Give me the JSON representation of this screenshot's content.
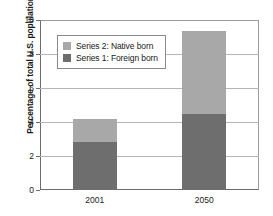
{
  "chart_data": {
    "type": "bar",
    "subtype": "stacked-vertical",
    "title": "",
    "xlabel": "",
    "ylabel": "Percentage of total U.S. population",
    "categories": [
      "2001",
      "2050"
    ],
    "series": [
      {
        "name": "Series 1: Foreign born",
        "values": [
          2.8,
          4.45
        ],
        "color": "#6e6e6e"
      },
      {
        "name": "Series 2: Native born",
        "values": [
          1.4,
          4.9
        ],
        "color": "#a8a8a8"
      }
    ],
    "stack_order": [
      "Series 1: Foreign born",
      "Series 2: Native born"
    ],
    "totals": [
      4.2,
      9.35
    ],
    "ylim": [
      0,
      10
    ],
    "yticks": [
      0,
      2,
      4,
      6,
      8,
      10
    ],
    "ytick_labels": [
      "0",
      "2",
      "4",
      "6",
      "8",
      "10"
    ],
    "grid": {
      "horizontal": true,
      "vertical": false
    },
    "legend": {
      "position": "upper-left-inside",
      "entries": [
        {
          "label": "Series 2: Native born",
          "color": "#a8a8a8"
        },
        {
          "label": "Series 1: Foreign born",
          "color": "#6e6e6e"
        }
      ]
    },
    "colors": {
      "native_born": "#a8a8a8",
      "foreign_born": "#6e6e6e",
      "gridline": "#b4b4b4",
      "axis": "#6b6b6b",
      "text": "#1a1a1a",
      "background": "#ffffff"
    }
  }
}
